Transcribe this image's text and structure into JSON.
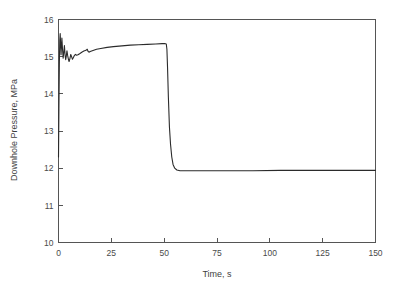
{
  "chart_data": {
    "type": "line",
    "title": "",
    "xlabel": "Time, s",
    "ylabel": "Downhole Pressure, MPa",
    "xlim": [
      0,
      150
    ],
    "ylim": [
      10,
      16
    ],
    "xticks": [
      0,
      25,
      50,
      75,
      100,
      125,
      150
    ],
    "yticks": [
      10,
      11,
      12,
      13,
      14,
      15,
      16
    ],
    "xtick_labels": [
      "0",
      "25",
      "50",
      "75",
      "100",
      "125",
      "150"
    ],
    "ytick_labels": [
      "10",
      "11",
      "12",
      "13",
      "14",
      "15",
      "16"
    ],
    "grid": false,
    "legend": false,
    "legend_position": "none",
    "line_color": "#2b2b2b",
    "frame_color": "#555555",
    "background_color": "#ffffff",
    "series": [
      {
        "name": "Downhole Pressure",
        "x": [
          0,
          0.2,
          0.4,
          0.6,
          0.8,
          1.0,
          1.2,
          1.4,
          1.6,
          1.9,
          2.2,
          2.5,
          2.8,
          3.1,
          3.4,
          3.7,
          4.0,
          4.3,
          4.7,
          5.0,
          5.4,
          5.8,
          6.2,
          6.6,
          7.0,
          7.5,
          8.0,
          8.6,
          9.2,
          10.0,
          11.0,
          12.0,
          13.0,
          13.6,
          14.0,
          14.4,
          15.0,
          16.0,
          18.0,
          20.0,
          23.0,
          26.0,
          30.0,
          34.0,
          38.0,
          42.0,
          46.0,
          49.0,
          50.5,
          51.0,
          51.3,
          51.6,
          52.0,
          52.5,
          53.0,
          53.6,
          54.2,
          55.0,
          56.0,
          57.5,
          59.0,
          61.0,
          64.0,
          68.0,
          74.0,
          82.0,
          92.0,
          105.0,
          120.0,
          135.0,
          150.0
        ],
        "y": [
          12.3,
          13.6,
          14.8,
          15.45,
          15.62,
          15.35,
          15.05,
          15.28,
          15.5,
          15.2,
          14.96,
          15.12,
          15.3,
          15.05,
          14.92,
          15.02,
          15.16,
          15.04,
          14.93,
          14.87,
          14.95,
          15.06,
          15.0,
          14.93,
          14.97,
          15.03,
          15.06,
          15.04,
          15.05,
          15.08,
          15.12,
          15.15,
          15.17,
          15.2,
          15.14,
          15.12,
          15.14,
          15.16,
          15.2,
          15.22,
          15.25,
          15.27,
          15.29,
          15.31,
          15.32,
          15.33,
          15.34,
          15.35,
          15.35,
          15.34,
          15.2,
          14.7,
          13.9,
          13.1,
          12.65,
          12.3,
          12.1,
          12.0,
          11.95,
          11.93,
          11.93,
          11.93,
          11.93,
          11.93,
          11.93,
          11.93,
          11.93,
          11.94,
          11.94,
          11.94,
          11.94
        ]
      }
    ],
    "annotations": []
  },
  "figure": {
    "ylabel_text": "Downhole Pressure, MPa",
    "xlabel_text": "Time, s"
  }
}
